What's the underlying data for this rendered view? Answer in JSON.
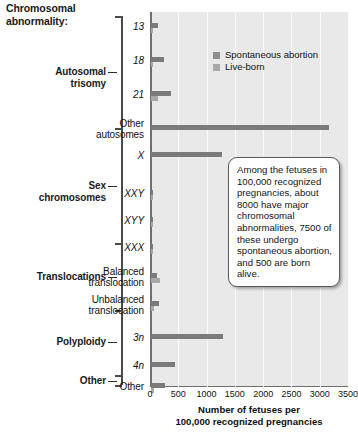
{
  "header": {
    "title_line1": "Chromosomal",
    "title_line2": "abnormality:"
  },
  "groups": [
    {
      "name": "autosomal-trisomy",
      "line1": "Autosomal",
      "line2": "trisomy"
    },
    {
      "name": "sex-chromosomes",
      "line1": "Sex",
      "line2": "chromosomes"
    },
    {
      "name": "translocations",
      "line1": "Translocations",
      "line2": ""
    },
    {
      "name": "polyploidy",
      "line1": "Polyploidy",
      "line2": ""
    },
    {
      "name": "other",
      "line1": "Other",
      "line2": ""
    }
  ],
  "legend": {
    "items": [
      {
        "label": "Spontaneous abortion",
        "color": "#8e8e8e"
      },
      {
        "label": "Live-born",
        "color": "#a9a9a9"
      }
    ]
  },
  "callout": {
    "text": "Among the fetuses in 100,000 recognized pregnancies, about 8000 have major chromosomal abnormalities, 7500 of these undergo spontaneous abortion, and 500 are born alive."
  },
  "chart_data": {
    "type": "bar",
    "orientation": "horizontal",
    "title": "",
    "xlabel_line1": "Number of fetuses per",
    "xlabel_line2": "100,000 recognized pregnancies",
    "ylabel": "Chromosomal abnormality:",
    "xlim": [
      0,
      3500
    ],
    "xticks": [
      0,
      500,
      1000,
      1500,
      2000,
      2500,
      3000,
      3500
    ],
    "xtick_labels": [
      "0",
      "500",
      "1000",
      "1500",
      "2000",
      "2500",
      "3000",
      "3500"
    ],
    "grid": true,
    "legend_position": "upper-right-inside",
    "categories": [
      "13",
      "18",
      "21",
      "Other autosomes",
      "X",
      "XXY",
      "XYY",
      "XXX",
      "Balanced translocation",
      "Unbalanced translocation",
      "3n",
      "4n",
      "Other"
    ],
    "category_italic": [
      true,
      true,
      true,
      false,
      true,
      true,
      true,
      true,
      false,
      false,
      true,
      true,
      false
    ],
    "series": [
      {
        "name": "Spontaneous abortion",
        "color": "#7b7b7b",
        "values": [
          128,
          224,
          350,
          3150,
          1250,
          12,
          10,
          10,
          110,
          150,
          1280,
          430,
          255
        ]
      },
      {
        "name": "Live-born",
        "color": "#a8a8a8",
        "values": [
          5,
          8,
          120,
          0,
          0,
          16,
          16,
          16,
          160,
          55,
          0,
          0,
          45
        ]
      }
    ]
  }
}
